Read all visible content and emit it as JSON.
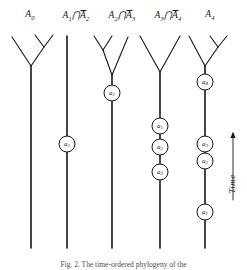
{
  "figure": {
    "width": 247,
    "height": 270,
    "background": "#ffffff",
    "ink_color": "#17171a"
  },
  "column_headers": [
    {
      "id": "h0",
      "text": "A0",
      "base": "A",
      "sub": "0",
      "overbar_term": "",
      "overbar_sub": "",
      "x": 30,
      "y": 16
    },
    {
      "id": "h1",
      "text": "A1 ∩ Ā2",
      "base": "A",
      "sub": "1",
      "overbar_term": "A",
      "overbar_sub": "2",
      "x": 76,
      "y": 16
    },
    {
      "id": "h2",
      "text": "A2 ∩ Ā3",
      "base": "A",
      "sub": "2",
      "overbar_term": "A",
      "overbar_sub": "3",
      "x": 122,
      "y": 16
    },
    {
      "id": "h3",
      "text": "A3 ∩ Ā4",
      "base": "A",
      "sub": "3",
      "overbar_term": "A",
      "overbar_sub": "4",
      "x": 168,
      "y": 16
    },
    {
      "id": "h4",
      "text": "A4",
      "base": "A",
      "sub": "4",
      "overbar_term": "",
      "overbar_sub": "",
      "x": 210,
      "y": 16
    }
  ],
  "intersection_symbol": "∩",
  "lineages": [
    {
      "id": "col-0",
      "header_ref": "h0",
      "trunk_x": 31,
      "trunk_top": 66,
      "trunk_bottom": 248,
      "branches": [
        {
          "from_x": 31,
          "from_y": 66,
          "to_x": 12,
          "to_y": 37
        },
        {
          "from_x": 31,
          "from_y": 66,
          "to_x": 44,
          "to_y": 47
        },
        {
          "from_x": 44,
          "from_y": 47,
          "to_x": 35,
          "to_y": 35
        },
        {
          "from_x": 44,
          "from_y": 47,
          "to_x": 53,
          "to_y": 35
        }
      ],
      "events": []
    },
    {
      "id": "col-1",
      "header_ref": "h1",
      "trunk_x": 67,
      "trunk_top": 36,
      "trunk_bottom": 248,
      "branches": [],
      "events": [
        {
          "label_base": "a",
          "label_sub": "1",
          "x": 67,
          "y": 144,
          "r": 8
        }
      ]
    },
    {
      "id": "col-2",
      "header_ref": "h2",
      "trunk_x": 112,
      "trunk_top": 75,
      "trunk_bottom": 248,
      "branches": [
        {
          "from_x": 112,
          "from_y": 75,
          "to_x": 128,
          "to_y": 37
        },
        {
          "from_x": 112,
          "from_y": 75,
          "to_x": 103,
          "to_y": 50
        },
        {
          "from_x": 103,
          "from_y": 50,
          "to_x": 94,
          "to_y": 36
        },
        {
          "from_x": 103,
          "from_y": 50,
          "to_x": 112,
          "to_y": 36
        }
      ],
      "events": [
        {
          "label_base": "a",
          "label_sub": "1",
          "x": 112,
          "y": 93,
          "r": 8
        }
      ]
    },
    {
      "id": "col-3",
      "header_ref": "h3",
      "trunk_x": 160,
      "trunk_top": 72,
      "trunk_bottom": 248,
      "branches": [
        {
          "from_x": 160,
          "from_y": 72,
          "to_x": 140,
          "to_y": 36
        },
        {
          "from_x": 160,
          "from_y": 72,
          "to_x": 180,
          "to_y": 36
        }
      ],
      "events": [
        {
          "label_base": "a",
          "label_sub": "1",
          "x": 160,
          "y": 126,
          "r": 8
        },
        {
          "label_base": "a",
          "label_sub": "2",
          "x": 160,
          "y": 147,
          "r": 8
        },
        {
          "label_base": "a",
          "label_sub": "3",
          "x": 160,
          "y": 172,
          "r": 8
        }
      ]
    },
    {
      "id": "col-4",
      "header_ref": "h4",
      "trunk_x": 205,
      "trunk_top": 66,
      "trunk_bottom": 248,
      "branches": [
        {
          "from_x": 205,
          "from_y": 66,
          "to_x": 189,
          "to_y": 36
        },
        {
          "from_x": 205,
          "from_y": 66,
          "to_x": 218,
          "to_y": 47
        },
        {
          "from_x": 218,
          "from_y": 47,
          "to_x": 210,
          "to_y": 36
        },
        {
          "from_x": 218,
          "from_y": 47,
          "to_x": 227,
          "to_y": 36
        }
      ],
      "events": [
        {
          "label_base": "a",
          "label_sub": "4",
          "x": 205,
          "y": 82,
          "r": 8
        },
        {
          "label_base": "a",
          "label_sub": "3",
          "x": 205,
          "y": 144,
          "r": 8
        },
        {
          "label_base": "a",
          "label_sub": "2",
          "x": 205,
          "y": 161,
          "r": 8
        },
        {
          "label_base": "a",
          "label_sub": "1",
          "x": 205,
          "y": 212,
          "r": 8
        }
      ]
    }
  ],
  "time_axis": {
    "label": "Time",
    "label_x": 236,
    "label_y": 185,
    "arrow_x": 233,
    "arrow_tail_y": 200,
    "arrow_head_y": 133,
    "direction": "up"
  },
  "caption": {
    "text": "Fig. 2. The time-ordered phylogeny of the",
    "visible": true
  }
}
